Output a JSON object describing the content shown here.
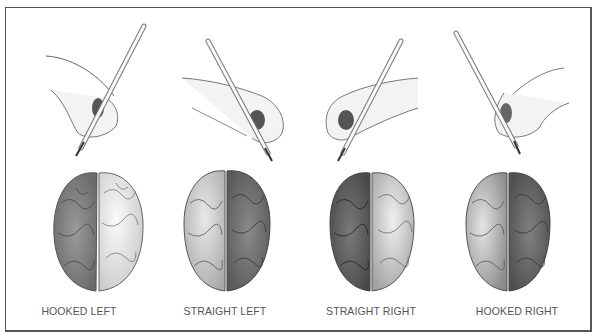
{
  "figure": {
    "colors": {
      "frame": "#555555",
      "caption": "#555555",
      "shaded_hemisphere": "#7a7a7a",
      "light_hemisphere": "#e6e6e6"
    },
    "panels": [
      {
        "label": "HOOKED LEFT",
        "hand": "left",
        "grip": "hooked",
        "shaded_side": "left"
      },
      {
        "label": "STRAIGHT LEFT",
        "hand": "left",
        "grip": "straight",
        "shaded_side": "right"
      },
      {
        "label": "STRAIGHT RIGHT",
        "hand": "right",
        "grip": "straight",
        "shaded_side": "left"
      },
      {
        "label": "HOOKED RIGHT",
        "hand": "right",
        "grip": "hooked",
        "shaded_side": "right"
      }
    ]
  }
}
